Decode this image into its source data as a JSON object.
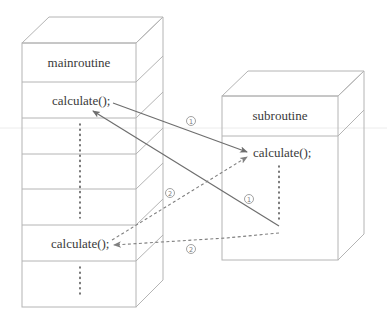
{
  "main_box": {
    "title": "mainroutine",
    "call_top": "calculate();",
    "call_bottom": "calculate();"
  },
  "sub_box": {
    "title": "subroutine",
    "call": "calculate();"
  },
  "steps": {
    "call1_out": "1",
    "call1_return": "1",
    "call2_out": "2",
    "call2_return": "2"
  },
  "colors": {
    "edge": "#b4b4b4",
    "arrow_solid": "#6e6e6e",
    "arrow_dashed": "#808080",
    "text": "#3a3a3a"
  }
}
